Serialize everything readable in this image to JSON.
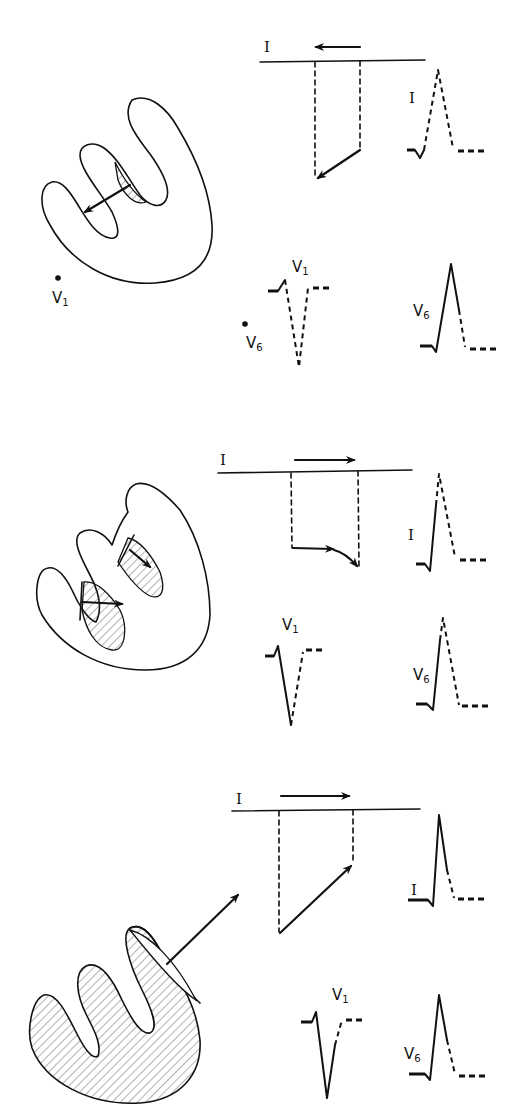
{
  "figure": {
    "colors": {
      "ink": "#111111",
      "background": "#ffffff"
    },
    "panels": [
      {
        "id": "panel-1",
        "phase": "septal depolarization",
        "axis_label": "I",
        "axis_arrow_direction": "left",
        "electrode_labels": {
          "v1": "V",
          "v1_sub": "1",
          "v6": "V",
          "v6_sub": "6"
        },
        "ecg_labels": {
          "lead_i": "I",
          "v1": "V",
          "v1_sub": "1",
          "v6": "V",
          "v6_sub": "6"
        }
      },
      {
        "id": "panel-2",
        "phase": "apical / free wall depolarization",
        "axis_label": "I",
        "axis_arrow_direction": "right",
        "ecg_labels": {
          "lead_i": "I",
          "v1": "V",
          "v1_sub": "1",
          "v6": "V",
          "v6_sub": "6"
        }
      },
      {
        "id": "panel-3",
        "phase": "late basal depolarization",
        "axis_label": "I",
        "axis_arrow_direction": "right",
        "ecg_labels": {
          "lead_i": "I",
          "v1": "V",
          "v1_sub": "1",
          "v6": "V",
          "v6_sub": "6"
        }
      }
    ]
  }
}
